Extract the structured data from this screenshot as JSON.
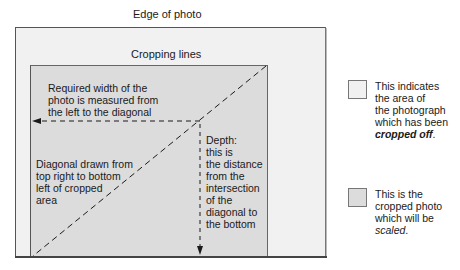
{
  "diagram": {
    "edge_label": "Edge of photo",
    "crop_label": "Cropping lines",
    "width_note": [
      "Required width of the",
      "photo is measured from",
      "the left to the diagonal"
    ],
    "diagonal_note": [
      "Diagonal drawn from",
      "top right to bottom",
      "left of cropped",
      "area"
    ],
    "depth_note": [
      "Depth:",
      "this is",
      "the distance",
      "from the",
      "intersection",
      "of the",
      "diagonal to",
      "the bottom"
    ]
  },
  "legend": {
    "items": [
      {
        "swatch_color": "#f1f1f1",
        "lines": [
          "This indicates",
          "the area of",
          "the photograph",
          "which has been"
        ],
        "emphasis": "cropped off",
        "suffix": "."
      },
      {
        "swatch_color": "#dcdcdc",
        "lines": [
          "This is the",
          "cropped photo",
          "which will be"
        ],
        "emphasis": "scaled",
        "suffix": "."
      }
    ]
  },
  "colors": {
    "cropped_off": "#f1f1f1",
    "cropped_photo": "#dcdcdc",
    "lines": "#1a1a1a"
  }
}
